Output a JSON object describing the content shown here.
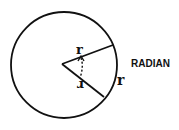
{
  "diagram": {
    "title": "RADIAN",
    "labels": {
      "radius_upper": "r",
      "radius_lower": "r",
      "arc": "r"
    },
    "colors": {
      "stroke": "#111111",
      "background": "#ffffff"
    }
  }
}
